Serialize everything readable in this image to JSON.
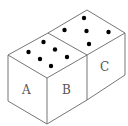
{
  "diagram": {
    "stroke_color": "#666666",
    "dot_color": "#000000",
    "faces": {
      "A": {
        "label": "A"
      },
      "B": {
        "label": "B"
      },
      "C": {
        "label": "C"
      }
    },
    "left_die_top_dots": 6,
    "right_die_top_dots": 5
  }
}
